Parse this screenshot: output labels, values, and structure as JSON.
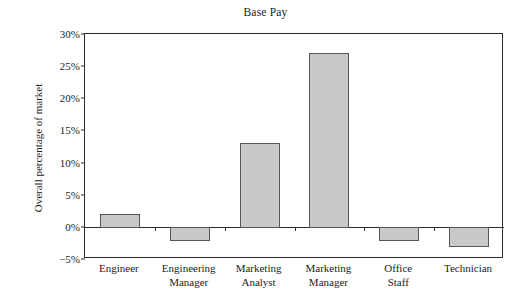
{
  "chart_data": {
    "type": "bar",
    "title": "Base Pay",
    "xlabel": "",
    "ylabel": "Overall percentage of market",
    "categories": [
      "Engineer",
      "Engineering Manager",
      "Marketing Analyst",
      "Marketing Manager",
      "Office Staff",
      "Technician"
    ],
    "category_lines": [
      [
        "Engineer",
        ""
      ],
      [
        "Engineering",
        "Manager"
      ],
      [
        "Marketing",
        "Analyst"
      ],
      [
        "Marketing",
        "Manager"
      ],
      [
        "Office",
        "Staff"
      ],
      [
        "Technician",
        ""
      ]
    ],
    "values": [
      2,
      -2,
      13,
      27,
      -2,
      -3
    ],
    "value_labels": [
      "2%",
      "-2%",
      "13%",
      "27%",
      "-2%",
      "-3%"
    ],
    "ylim": [
      -5,
      30
    ],
    "yticks": [
      -5,
      0,
      5,
      10,
      15,
      20,
      25,
      30
    ],
    "ytick_labels": [
      "−5%",
      "0%",
      "5%",
      "10%",
      "15%",
      "20%",
      "25%",
      "30%"
    ],
    "grid": false,
    "legend": null,
    "bar_fill_color": "#c9c9c9",
    "bar_edge_color": "#575757",
    "axis_color": "#2b2b2b"
  }
}
